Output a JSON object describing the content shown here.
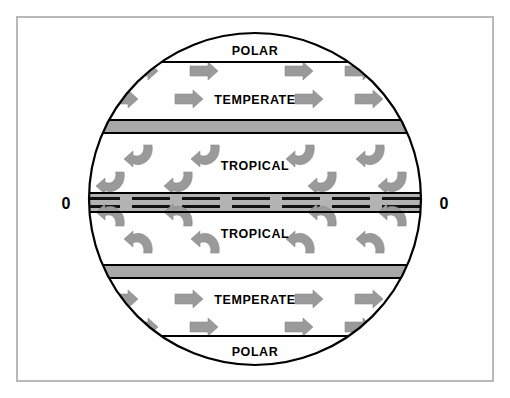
{
  "figure": {
    "background_color": "#ffffff",
    "frame_color": "#b9b9b9",
    "outline_color": "#000000",
    "arrow_color": "#9a9a9a",
    "band_color": "#a8a8a8",
    "equator_band_color": "#b3b3b3"
  },
  "equator": {
    "left_label": "0",
    "right_label": "0"
  },
  "zones": [
    {
      "id": "polar-north",
      "label": "POLAR",
      "hemisphere": "north",
      "arrow_style": "none"
    },
    {
      "id": "temperate-north",
      "label": "TEMPERATE",
      "hemisphere": "north",
      "arrow_style": "straight-right"
    },
    {
      "id": "tropical-north",
      "label": "TROPICAL",
      "hemisphere": "north",
      "arrow_style": "hook-down-left"
    },
    {
      "id": "tropical-south",
      "label": "TROPICAL",
      "hemisphere": "south",
      "arrow_style": "hook-up-left"
    },
    {
      "id": "temperate-south",
      "label": "TEMPERATE",
      "hemisphere": "south",
      "arrow_style": "straight-right"
    },
    {
      "id": "polar-south",
      "label": "POLAR",
      "hemisphere": "south",
      "arrow_style": "none"
    }
  ],
  "bands": {
    "subtropical_north": {
      "name": "northern gray band"
    },
    "subtropical_south": {
      "name": "southern gray band"
    },
    "equatorial": {
      "name": "equatorial doldrums band",
      "dash_groups": 7,
      "lines_per_group": 2
    }
  },
  "arrow_rows": {
    "temperate_north_upper": 4,
    "temperate_north_lower": 4,
    "tropical_north_upper": 4,
    "tropical_north_lower": 4,
    "tropical_south_upper": 4,
    "tropical_south_lower": 4,
    "temperate_south_upper": 4,
    "temperate_south_lower": 4
  }
}
